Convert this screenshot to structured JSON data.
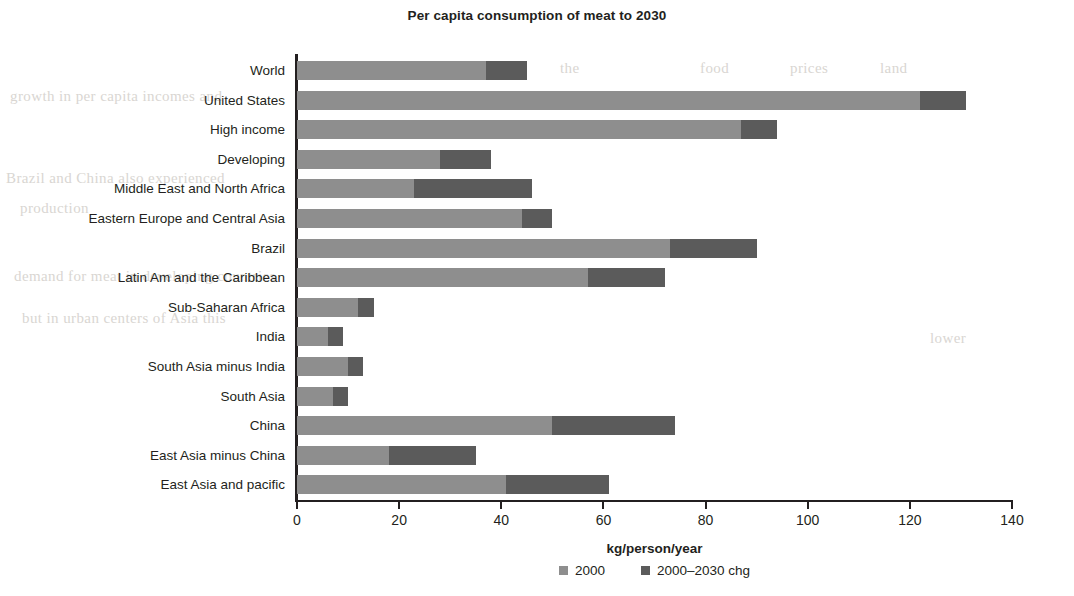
{
  "chart_data": {
    "type": "bar",
    "orientation": "horizontal",
    "stacked": true,
    "title": "Per capita consumption of meat to 2030",
    "xlabel": "kg/person/year",
    "ylabel": "",
    "xlim": [
      0,
      140
    ],
    "xticks": [
      0,
      20,
      40,
      60,
      80,
      100,
      120,
      140
    ],
    "xtick_labels": [
      "0",
      "20",
      "40",
      "60",
      "80",
      "100",
      "120",
      "140"
    ],
    "grid": false,
    "legend_position": "bottom",
    "categories": [
      "World",
      "United States",
      "High income",
      "Developing",
      "Middle East and North Africa",
      "Eastern Europe and Central Asia",
      "Brazil",
      "Latin Am and the Caribbean",
      "Sub-Saharan Africa",
      "India",
      "South Asia minus India",
      "South Asia",
      "China",
      "East Asia minus China",
      "East Asia and pacific"
    ],
    "series": [
      {
        "name": "2000",
        "color": "#8e8e8e",
        "values": [
          37,
          122,
          87,
          28,
          23,
          44,
          73,
          57,
          12,
          6,
          10,
          7,
          50,
          18,
          41
        ]
      },
      {
        "name": "2000–2030 chg",
        "color": "#5b5b5b",
        "values": [
          8,
          9,
          7,
          10,
          23,
          6,
          17,
          15,
          3,
          3,
          3,
          3,
          24,
          17,
          20
        ]
      }
    ],
    "totals": [
      45,
      131,
      94,
      38,
      46,
      50,
      90,
      72,
      15,
      9,
      13,
      10,
      74,
      35,
      61
    ]
  },
  "legend": {
    "items": [
      {
        "label": "2000",
        "color": "#8e8e8e"
      },
      {
        "label": "2000–2030 chg",
        "color": "#5b5b5b"
      }
    ]
  },
  "background_text": [
    "quality",
    "year",
    "the",
    "food",
    "prices",
    "land",
    "growth in per capita incomes and",
    "Brazil and China also experienced",
    "production",
    "demand for meat in developing countries",
    "but in urban centers of Asia this",
    "lower"
  ]
}
